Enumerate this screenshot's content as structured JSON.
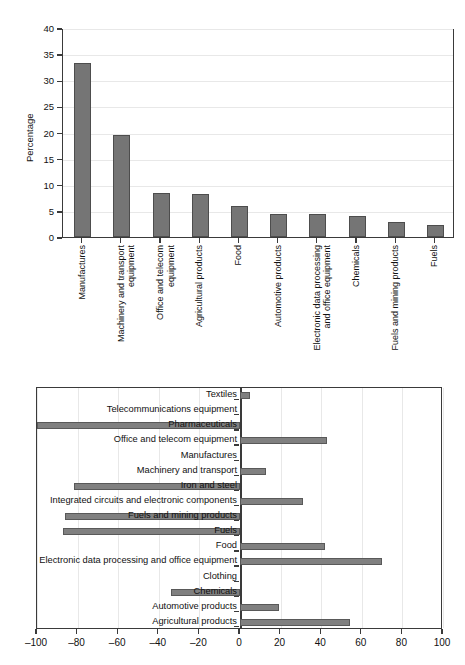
{
  "chart_data": [
    {
      "type": "bar",
      "orientation": "vertical",
      "title": "",
      "xlabel": "",
      "ylabel": "Percentage",
      "ylim": [
        0,
        40
      ],
      "yticks": [
        0,
        5,
        10,
        15,
        20,
        25,
        30,
        35,
        40
      ],
      "grid": "horizontal",
      "legend": "none",
      "bar_color": "#757575",
      "categories": [
        "Manufactures",
        "Machinery and transport equipment",
        "Office and telecom equipment",
        "Agricultural products",
        "Food",
        "Automotive products",
        "Electronic data processing and office equipment",
        "Chemicals",
        "Fuels and mining products",
        "Fuels"
      ],
      "category_lines": [
        [
          "Manufactures"
        ],
        [
          "Machinery and transport",
          "equipment"
        ],
        [
          "Office and telecom",
          "equipment"
        ],
        [
          "Agricultural products"
        ],
        [
          "Food"
        ],
        [
          "Automotive products"
        ],
        [
          "Electronic data processing",
          "and office equipment"
        ],
        [
          "Chemicals"
        ],
        [
          "Fuels and mining products"
        ],
        [
          "Fuels"
        ]
      ],
      "values": [
        33.4,
        19.5,
        8.5,
        8.3,
        6.0,
        4.4,
        4.4,
        4.0,
        2.9,
        2.3
      ]
    },
    {
      "type": "bar",
      "orientation": "horizontal",
      "title": "",
      "xlabel": "",
      "ylabel": "",
      "xlim": [
        -100,
        100
      ],
      "xticks": [
        -100,
        -80,
        -60,
        -40,
        -20,
        0,
        20,
        40,
        60,
        80,
        100
      ],
      "xtick_labels": [
        "–100",
        "–80",
        "–60",
        "–40",
        "–20",
        "0",
        "20",
        "40",
        "60",
        "80",
        "100"
      ],
      "grid": "vertical",
      "legend": "none",
      "bar_color": "#808080",
      "categories": [
        "Textiles",
        "Telecommunications equipment",
        "Pharmaceuticals",
        "Office and telecom equipment",
        "Manufactures",
        "Machinery and transport",
        "Iron and steel",
        "Integrated circuits and electronic components",
        "Fuels and mining products",
        "Fuels",
        "Food",
        "Electronic data processing and office equipment",
        "Clothing",
        "Chemicals",
        "Automotive products",
        "Agricultural products"
      ],
      "values": [
        5,
        0,
        -100,
        43,
        0,
        13,
        -82,
        31,
        -86,
        -87,
        42,
        70,
        0,
        -34,
        19,
        54
      ]
    }
  ]
}
